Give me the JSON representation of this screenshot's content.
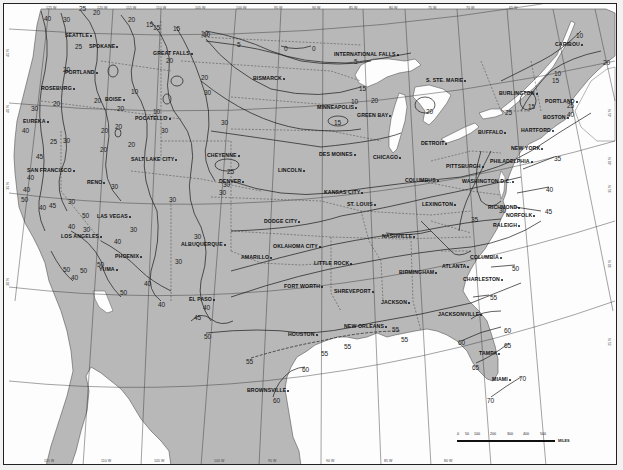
{
  "map": {
    "title": "",
    "type": "isotherm contour map",
    "region": "Contiguous United States",
    "colors": {
      "land": "#b8b8b8",
      "water": "#fdfdfd",
      "contour": "#222222",
      "frame": "#222222"
    }
  },
  "longitude_ticks_top": [
    "125 W",
    "120 W",
    "115 W",
    "110 W",
    "105 W",
    "100 W",
    "95 W",
    "90 W",
    "85 W",
    "80 W",
    "75 W",
    "70 W",
    "65 W"
  ],
  "longitude_ticks_bottom": [
    "115 W",
    "110 W",
    "105 W",
    "100 W",
    "95 W",
    "90 W",
    "85 W",
    "80 W"
  ],
  "latitude_ticks_left": [
    "45 N",
    "40 N",
    "35 N",
    "30 N"
  ],
  "latitude_ticks_right": [
    "45 N",
    "40 N",
    "35 N",
    "30 N",
    "25 N"
  ],
  "cities": [
    {
      "name": "SEATTLE",
      "x": 64,
      "y": 31
    },
    {
      "name": "SPOKANE",
      "x": 88,
      "y": 42
    },
    {
      "name": "GREAT FALLS",
      "x": 152,
      "y": 49
    },
    {
      "name": "PORTLAND",
      "x": 64,
      "y": 68
    },
    {
      "name": "ROSEBURG",
      "x": 40,
      "y": 84
    },
    {
      "name": "BOISE",
      "x": 104,
      "y": 95
    },
    {
      "name": "POCATELLO",
      "x": 134,
      "y": 114
    },
    {
      "name": "EUREKA",
      "x": 22,
      "y": 117
    },
    {
      "name": "SALT LAKE CITY",
      "x": 130,
      "y": 155
    },
    {
      "name": "RENO",
      "x": 86,
      "y": 178
    },
    {
      "name": "SAN FRANCISCO",
      "x": 26,
      "y": 166
    },
    {
      "name": "CHEYENNE",
      "x": 206,
      "y": 151
    },
    {
      "name": "DENVER",
      "x": 218,
      "y": 177
    },
    {
      "name": "LAS VEGAS",
      "x": 96,
      "y": 212
    },
    {
      "name": "LOS ANGELES",
      "x": 60,
      "y": 232
    },
    {
      "name": "ALBUQUERQUE",
      "x": 180,
      "y": 240
    },
    {
      "name": "PHOENIX",
      "x": 114,
      "y": 252
    },
    {
      "name": "YUMA",
      "x": 98,
      "y": 265
    },
    {
      "name": "EL PASO",
      "x": 188,
      "y": 295
    },
    {
      "name": "BISMARCK",
      "x": 252,
      "y": 74
    },
    {
      "name": "INTERNATIONAL FALLS",
      "x": 333,
      "y": 50
    },
    {
      "name": "MINNEAPOLIS",
      "x": 316,
      "y": 103
    },
    {
      "name": "GREEN BAY",
      "x": 356,
      "y": 111
    },
    {
      "name": "S. STE. MARIE",
      "x": 425,
      "y": 76
    },
    {
      "name": "CARIBOU",
      "x": 554,
      "y": 40
    },
    {
      "name": "BURLINGTON",
      "x": 498,
      "y": 89
    },
    {
      "name": "PORTLAND",
      "x": 544,
      "y": 97
    },
    {
      "name": "BOSTON",
      "x": 542,
      "y": 113
    },
    {
      "name": "HARTFORD",
      "x": 520,
      "y": 126
    },
    {
      "name": "BUFFALO",
      "x": 477,
      "y": 128
    },
    {
      "name": "DETROIT",
      "x": 420,
      "y": 139
    },
    {
      "name": "NEW YORK",
      "x": 510,
      "y": 144
    },
    {
      "name": "DES MOINES",
      "x": 318,
      "y": 150
    },
    {
      "name": "CHICAGO",
      "x": 372,
      "y": 153
    },
    {
      "name": "PHILADELPHIA",
      "x": 489,
      "y": 157
    },
    {
      "name": "PITTSBURGH",
      "x": 445,
      "y": 162
    },
    {
      "name": "LINCOLN",
      "x": 277,
      "y": 166
    },
    {
      "name": "COLUMBUS",
      "x": 404,
      "y": 176
    },
    {
      "name": "WASHINGTON D.C.",
      "x": 461,
      "y": 177
    },
    {
      "name": "KANSAS CITY",
      "x": 323,
      "y": 188
    },
    {
      "name": "ST. LOUIS",
      "x": 346,
      "y": 200
    },
    {
      "name": "LEXINGTON",
      "x": 421,
      "y": 200
    },
    {
      "name": "RICHMOND",
      "x": 487,
      "y": 203
    },
    {
      "name": "NORFOLK",
      "x": 505,
      "y": 211
    },
    {
      "name": "DODGE CITY",
      "x": 263,
      "y": 217
    },
    {
      "name": "NASHVILLE",
      "x": 381,
      "y": 232
    },
    {
      "name": "RALEIGH",
      "x": 492,
      "y": 221
    },
    {
      "name": "OKLAHOMA CITY",
      "x": 272,
      "y": 242
    },
    {
      "name": "AMARILLO",
      "x": 240,
      "y": 253
    },
    {
      "name": "LITTLE ROCK",
      "x": 313,
      "y": 259
    },
    {
      "name": "COLUMBIA",
      "x": 469,
      "y": 253
    },
    {
      "name": "ATLANTA",
      "x": 441,
      "y": 262
    },
    {
      "name": "BIRMINGHAM",
      "x": 398,
      "y": 268
    },
    {
      "name": "CHARLESTON",
      "x": 462,
      "y": 275
    },
    {
      "name": "FORT WORTH",
      "x": 283,
      "y": 282
    },
    {
      "name": "SHREVEPORT",
      "x": 333,
      "y": 287
    },
    {
      "name": "JACKSON",
      "x": 380,
      "y": 298
    },
    {
      "name": "JACKSONVILLE",
      "x": 437,
      "y": 310
    },
    {
      "name": "HOUSTON",
      "x": 287,
      "y": 330
    },
    {
      "name": "NEW ORLEANS",
      "x": 343,
      "y": 322
    },
    {
      "name": "TAMPA",
      "x": 478,
      "y": 349
    },
    {
      "name": "MIAMI",
      "x": 491,
      "y": 375
    },
    {
      "name": "BROWNSVILLE",
      "x": 246,
      "y": 386
    }
  ],
  "isotherm_labels": [
    {
      "v": "40",
      "x": 43,
      "y": 14
    },
    {
      "v": "30",
      "x": 62,
      "y": 15
    },
    {
      "v": "25",
      "x": 78,
      "y": 4
    },
    {
      "v": "20",
      "x": 92,
      "y": 8
    },
    {
      "v": "20",
      "x": 127,
      "y": 15
    },
    {
      "v": "15",
      "x": 145,
      "y": 20
    },
    {
      "v": "15",
      "x": 152,
      "y": 23
    },
    {
      "v": "15",
      "x": 172,
      "y": 24
    },
    {
      "v": "10",
      "x": 202,
      "y": 30
    },
    {
      "v": "25",
      "x": 74,
      "y": 42
    },
    {
      "v": "20",
      "x": 165,
      "y": 56
    },
    {
      "v": "20",
      "x": 200,
      "y": 73
    },
    {
      "v": "20",
      "x": 62,
      "y": 65
    },
    {
      "v": "20",
      "x": 52,
      "y": 99
    },
    {
      "v": "20",
      "x": 93,
      "y": 96
    },
    {
      "v": "20",
      "x": 116,
      "y": 104
    },
    {
      "v": "10",
      "x": 130,
      "y": 87
    },
    {
      "v": "10",
      "x": 152,
      "y": 107
    },
    {
      "v": "30",
      "x": 30,
      "y": 104
    },
    {
      "v": "40",
      "x": 21,
      "y": 126
    },
    {
      "v": "20",
      "x": 114,
      "y": 122
    },
    {
      "v": "20",
      "x": 100,
      "y": 126
    },
    {
      "v": "30",
      "x": 160,
      "y": 126
    },
    {
      "v": "45",
      "x": 35,
      "y": 152
    },
    {
      "v": "25",
      "x": 49,
      "y": 137
    },
    {
      "v": "30",
      "x": 62,
      "y": 136
    },
    {
      "v": "20",
      "x": 99,
      "y": 145
    },
    {
      "v": "20",
      "x": 127,
      "y": 140
    },
    {
      "v": "40",
      "x": 26,
      "y": 173
    },
    {
      "v": "40",
      "x": 22,
      "y": 185
    },
    {
      "v": "50",
      "x": 20,
      "y": 195
    },
    {
      "v": "40",
      "x": 38,
      "y": 203
    },
    {
      "v": "45",
      "x": 48,
      "y": 201
    },
    {
      "v": "30",
      "x": 67,
      "y": 197
    },
    {
      "v": "50",
      "x": 81,
      "y": 211
    },
    {
      "v": "40",
      "x": 67,
      "y": 222
    },
    {
      "v": "30",
      "x": 82,
      "y": 225
    },
    {
      "v": "40",
      "x": 113,
      "y": 237
    },
    {
      "v": "30",
      "x": 129,
      "y": 225
    },
    {
      "v": "30",
      "x": 110,
      "y": 182
    },
    {
      "v": "30",
      "x": 168,
      "y": 195
    },
    {
      "v": "50",
      "x": 62,
      "y": 265
    },
    {
      "v": "40",
      "x": 70,
      "y": 273
    },
    {
      "v": "50",
      "x": 79,
      "y": 266
    },
    {
      "v": "50",
      "x": 96,
      "y": 260
    },
    {
      "v": "40",
      "x": 143,
      "y": 279
    },
    {
      "v": "50",
      "x": 119,
      "y": 288
    },
    {
      "v": "40",
      "x": 157,
      "y": 300
    },
    {
      "v": "40",
      "x": 202,
      "y": 303
    },
    {
      "v": "30",
      "x": 174,
      "y": 257
    },
    {
      "v": "30",
      "x": 193,
      "y": 232
    },
    {
      "v": "25",
      "x": 226,
      "y": 167
    },
    {
      "v": "30",
      "x": 222,
      "y": 180
    },
    {
      "v": "30",
      "x": 218,
      "y": 188
    },
    {
      "v": "10",
      "x": 200,
      "y": 29
    },
    {
      "v": "5",
      "x": 236,
      "y": 40
    },
    {
      "v": "0",
      "x": 283,
      "y": 44
    },
    {
      "v": "0",
      "x": 311,
      "y": 44
    },
    {
      "v": "5",
      "x": 353,
      "y": 57
    },
    {
      "v": "15",
      "x": 358,
      "y": 84
    },
    {
      "v": "10",
      "x": 350,
      "y": 97
    },
    {
      "v": "20",
      "x": 370,
      "y": 96
    },
    {
      "v": "15",
      "x": 333,
      "y": 118
    },
    {
      "v": "30",
      "x": 203,
      "y": 88
    },
    {
      "v": "30",
      "x": 220,
      "y": 118
    },
    {
      "v": "20",
      "x": 425,
      "y": 107
    },
    {
      "v": "10",
      "x": 575,
      "y": 31
    },
    {
      "v": "10",
      "x": 553,
      "y": 69
    },
    {
      "v": "15",
      "x": 551,
      "y": 76
    },
    {
      "v": "20",
      "x": 602,
      "y": 58
    },
    {
      "v": "15",
      "x": 527,
      "y": 102
    },
    {
      "v": "25",
      "x": 504,
      "y": 108
    },
    {
      "v": "25",
      "x": 566,
      "y": 101
    },
    {
      "v": "40",
      "x": 566,
      "y": 110
    },
    {
      "v": "30",
      "x": 498,
      "y": 206
    },
    {
      "v": "35",
      "x": 470,
      "y": 215
    },
    {
      "v": "35",
      "x": 553,
      "y": 154
    },
    {
      "v": "40",
      "x": 545,
      "y": 185
    },
    {
      "v": "45",
      "x": 544,
      "y": 207
    },
    {
      "v": "50",
      "x": 511,
      "y": 264
    },
    {
      "v": "55",
      "x": 489,
      "y": 293
    },
    {
      "v": "60",
      "x": 503,
      "y": 326
    },
    {
      "v": "60",
      "x": 457,
      "y": 338
    },
    {
      "v": "65",
      "x": 503,
      "y": 341
    },
    {
      "v": "65",
      "x": 471,
      "y": 363
    },
    {
      "v": "70",
      "x": 518,
      "y": 374
    },
    {
      "v": "70",
      "x": 486,
      "y": 396
    },
    {
      "v": "55",
      "x": 391,
      "y": 325
    },
    {
      "v": "55",
      "x": 343,
      "y": 342
    },
    {
      "v": "55",
      "x": 400,
      "y": 335
    },
    {
      "v": "50",
      "x": 203,
      "y": 332
    },
    {
      "v": "45",
      "x": 193,
      "y": 313
    },
    {
      "v": "55",
      "x": 245,
      "y": 357
    },
    {
      "v": "60",
      "x": 301,
      "y": 365
    },
    {
      "v": "60",
      "x": 272,
      "y": 396
    },
    {
      "v": "55",
      "x": 320,
      "y": 349
    }
  ],
  "scale_bar": {
    "ticks": [
      "0",
      "50",
      "100",
      "200",
      "300",
      "400",
      "500"
    ],
    "unit": "MILES"
  }
}
